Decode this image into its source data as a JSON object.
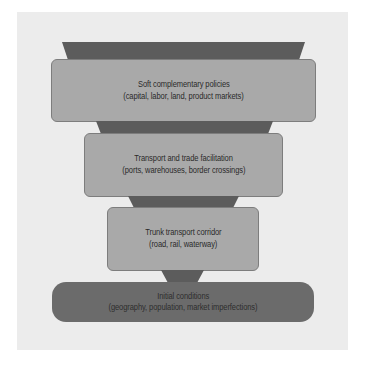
{
  "diagram": {
    "type": "layered-funnel",
    "colors": {
      "panel_background": "#ececec",
      "connector_fill": "#5c5c5c",
      "box_fill": "#a9a9a9",
      "base_fill": "#6b6b6b",
      "text": "#2a2a2a"
    },
    "layers": [
      {
        "title": "Soft complementary policies",
        "subtitle": "(capital, labor, land, product markets)"
      },
      {
        "title": "Transport and trade facilitation",
        "subtitle": "(ports, warehouses, border crossings)"
      },
      {
        "title": "Trunk transport corridor",
        "subtitle": "(road, rail, waterway)"
      },
      {
        "title": "Initial conditions",
        "subtitle": "(geography, population, market imperfections)"
      }
    ]
  }
}
